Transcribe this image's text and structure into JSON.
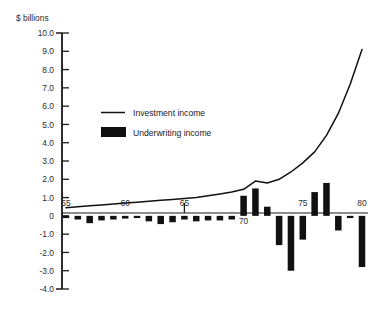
{
  "chart_data": {
    "type": "bar",
    "title": "",
    "subtitle": "",
    "ylabel": "$ billions",
    "xlabel": "",
    "ylim": [
      -4.0,
      10.0
    ],
    "xlim": [
      1955,
      1980
    ],
    "grid": false,
    "legend_position": "inside-upper-left",
    "y_ticks": [
      "10.0",
      "9.0",
      "8.0",
      "7.0",
      "6.0",
      "5.0",
      "4.0",
      "3.0",
      "2.0",
      "1.0",
      "0",
      "-1.0",
      "-2.0",
      "-3.0",
      "-4.0"
    ],
    "y_tick_values": [
      10.0,
      9.0,
      8.0,
      7.0,
      6.0,
      5.0,
      4.0,
      3.0,
      2.0,
      1.0,
      0,
      -1.0,
      -2.0,
      -3.0,
      -4.0
    ],
    "x_ticks": [
      "55",
      "60",
      "65",
      "70",
      "75",
      "80"
    ],
    "x_tick_values": [
      1955,
      1960,
      1965,
      1970,
      1975,
      1980
    ],
    "categories": [
      1955,
      1956,
      1957,
      1958,
      1959,
      1960,
      1961,
      1962,
      1963,
      1964,
      1965,
      1966,
      1967,
      1968,
      1969,
      1970,
      1971,
      1972,
      1973,
      1974,
      1975,
      1976,
      1977,
      1978,
      1979,
      1980
    ],
    "series": [
      {
        "name": "Underwriting income",
        "type": "bar",
        "color": "#111111",
        "values": [
          -0.1,
          -0.2,
          -0.4,
          -0.25,
          -0.2,
          -0.15,
          -0.1,
          -0.3,
          -0.45,
          -0.35,
          -0.2,
          -0.3,
          -0.25,
          -0.25,
          -0.2,
          1.1,
          1.5,
          0.5,
          -1.6,
          -3.0,
          -1.3,
          1.3,
          1.8,
          -0.8,
          -0.1,
          -2.8
        ]
      },
      {
        "name": "Investment income",
        "type": "line",
        "color": "#111111",
        "values": [
          0.45,
          0.5,
          0.55,
          0.6,
          0.65,
          0.7,
          0.75,
          0.8,
          0.85,
          0.9,
          0.95,
          1.0,
          1.1,
          1.2,
          1.3,
          1.45,
          1.9,
          1.8,
          2.0,
          2.4,
          2.9,
          3.5,
          4.4,
          5.6,
          7.2,
          9.1
        ]
      }
    ],
    "legend": [
      {
        "label": "Investment income",
        "marker": "line",
        "color": "#111111"
      },
      {
        "label": "Underwriting income",
        "marker": "swatch",
        "color": "#111111"
      }
    ]
  },
  "colors": {
    "ink": "#111111",
    "axis": "#1a1a1a",
    "background": "#ffffff"
  }
}
